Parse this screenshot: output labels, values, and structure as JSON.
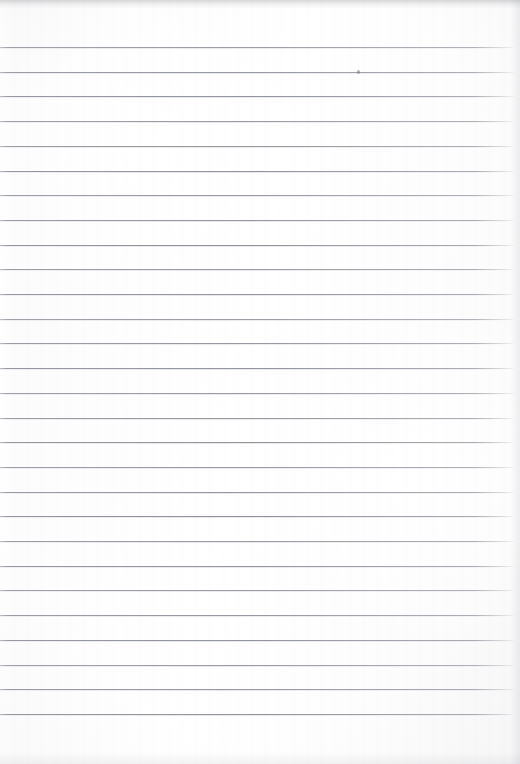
{
  "document": {
    "kind": "scanned-lined-paper",
    "description": "Blank ruled notebook page, scanned",
    "content_text": "",
    "width": 520,
    "height": 764
  },
  "paper": {
    "background_color": "#fdfdfd",
    "edge_tint_color": "#9a9ca2",
    "vignette_color": "#a0a3aa"
  },
  "ruling": {
    "line_color": "#7a7e88",
    "line_thickness_px": 1,
    "first_line_y": 47,
    "line_spacing_px": 24.7,
    "line_count": 28,
    "left_inset_px": 0,
    "right_end_px": 515,
    "top_margin_px": 47,
    "bottom_margin_px": 50
  },
  "marks": [
    {
      "name": "pencil-speck",
      "x": 357,
      "y": 70,
      "width": 3,
      "height": 4
    }
  ],
  "annotations": {
    "handwriting": [],
    "headings": [],
    "page_number": ""
  }
}
